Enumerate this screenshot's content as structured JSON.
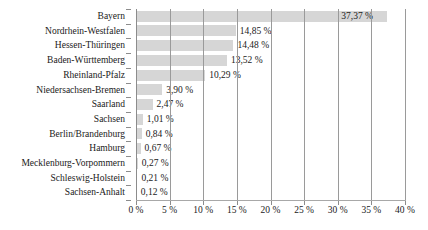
{
  "chart_data": {
    "type": "bar",
    "orientation": "horizontal",
    "title": "",
    "xlabel": "",
    "ylabel": "",
    "xlim": [
      0,
      40
    ],
    "grid": true,
    "legend": null,
    "bar_color": "#d6d6d6",
    "categories": [
      "Bayern",
      "Nordrhein-Westfalen",
      "Hessen-Thüringen",
      "Baden-Württemberg",
      "Rheinland-Pfalz",
      "Niedersachsen-Bremen",
      "Saarland",
      "Sachsen",
      "Berlin/Brandenburg",
      "Hamburg",
      "Mecklenburg-Vorpommern",
      "Schleswig-Holstein",
      "Sachsen-Anhalt"
    ],
    "values": [
      37.37,
      14.85,
      14.48,
      13.52,
      10.29,
      3.9,
      2.47,
      1.01,
      0.84,
      0.67,
      0.27,
      0.21,
      0.12
    ],
    "value_labels": [
      "37,37 %",
      "14,85 %",
      "14,48 %",
      "13,52 %",
      "10,29 %",
      "3,90 %",
      "2,47 %",
      "1,01 %",
      "0,84 %",
      "0,67 %",
      "0,27 %",
      "0,21 %",
      "0,12 %"
    ],
    "xticks": [
      0,
      5,
      10,
      15,
      20,
      25,
      30,
      35,
      40
    ],
    "xtick_labels": [
      "0 %",
      "5 %",
      "10 %",
      "15 %",
      "20 %",
      "25 %",
      "30 %",
      "35 %",
      "40 %"
    ]
  }
}
